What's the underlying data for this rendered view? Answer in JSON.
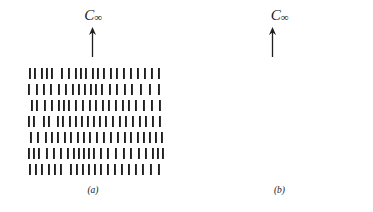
{
  "figure": {
    "background_color": "#ffffff",
    "ink_color": "#1f1f1f",
    "panels": [
      {
        "id": "a",
        "caption": "(a)",
        "axis_label_main": "C",
        "axis_label_subscript": "∞",
        "axis_arrow_direction": "up",
        "mesogen_style": "rod",
        "mesogen_polarity": "apolar",
        "row_count": 7,
        "description_rows": [
          {
            "direction": "none",
            "count": 21
          },
          {
            "direction": "none",
            "count": 19
          },
          {
            "direction": "none",
            "count": 20
          },
          {
            "direction": "none",
            "count": 21
          },
          {
            "direction": "none",
            "count": 21
          },
          {
            "direction": "none",
            "count": 22
          },
          {
            "direction": "none",
            "count": 20
          }
        ]
      },
      {
        "id": "b",
        "caption": "(b)",
        "axis_label_main": "C",
        "axis_label_subscript": "∞",
        "axis_arrow_direction": "up",
        "mesogen_style": "arrow",
        "mesogen_polarity": "polar",
        "row_count": 8,
        "description_rows": [
          {
            "direction": "down",
            "count": 21
          },
          {
            "direction": "up",
            "count": 20
          },
          {
            "direction": "down",
            "count": 21
          },
          {
            "direction": "up",
            "count": 20
          },
          {
            "direction": "down",
            "count": 21
          },
          {
            "direction": "up",
            "count": 21
          },
          {
            "direction": "down",
            "count": 22
          },
          {
            "direction": "up",
            "count": 22
          }
        ]
      }
    ]
  },
  "chart_data": {
    "type": "diagram",
    "title": "",
    "xlabel": "",
    "ylabel": "",
    "grid": false,
    "legend_position": "none",
    "panel_a": {
      "label": "(a)",
      "symmetry_axis": "C∞",
      "element_type": "rod",
      "rows": [
        {
          "y": 4,
          "x": [
            2,
            7,
            14,
            19,
            24,
            34,
            41,
            48,
            53,
            58,
            65,
            70,
            76,
            83,
            89,
            96,
            103,
            110,
            117,
            124,
            131
          ]
        },
        {
          "y": 20,
          "x": [
            1,
            9,
            16,
            23,
            31,
            38,
            45,
            51,
            57,
            63,
            68,
            74,
            82,
            89,
            97,
            104,
            113,
            122,
            131
          ]
        },
        {
          "y": 36,
          "x": [
            4,
            9,
            17,
            24,
            31,
            36,
            41,
            48,
            55,
            62,
            68,
            75,
            81,
            88,
            95,
            101,
            108,
            116,
            124,
            132
          ]
        },
        {
          "y": 52,
          "x": [
            1,
            6,
            16,
            21,
            30,
            35,
            42,
            48,
            54,
            60,
            66,
            72,
            78,
            85,
            92,
            98,
            105,
            112,
            118,
            125,
            132
          ]
        },
        {
          "y": 68,
          "x": [
            3,
            10,
            18,
            24,
            30,
            37,
            43,
            50,
            56,
            62,
            69,
            76,
            83,
            90,
            97,
            103,
            110,
            116,
            122,
            128,
            134
          ]
        },
        {
          "y": 84,
          "x": [
            1,
            6,
            11,
            19,
            26,
            33,
            40,
            46,
            51,
            56,
            61,
            66,
            73,
            80,
            88,
            96,
            103,
            111,
            118,
            125,
            130,
            135
          ]
        },
        {
          "y": 100,
          "x": [
            2,
            8,
            14,
            21,
            27,
            33,
            43,
            49,
            55,
            61,
            67,
            73,
            80,
            87,
            94,
            101,
            108,
            115,
            123,
            131
          ]
        }
      ]
    },
    "panel_b": {
      "label": "(b)",
      "symmetry_axis": "C∞",
      "element_type": "arrow",
      "rows": [
        {
          "y": 2,
          "dir": "down",
          "x": [
            4,
            12,
            17,
            24,
            31,
            38,
            44,
            51,
            58,
            64,
            70,
            77,
            83,
            90,
            96,
            103,
            110,
            117,
            124,
            131,
            138
          ]
        },
        {
          "y": 16,
          "dir": "up",
          "x": [
            3,
            10,
            16,
            23,
            30,
            36,
            43,
            50,
            56,
            63,
            70,
            77,
            84,
            91,
            98,
            105,
            112,
            119,
            127,
            137
          ]
        },
        {
          "y": 33,
          "dir": "down",
          "x": [
            2,
            9,
            14,
            20,
            27,
            34,
            40,
            47,
            53,
            59,
            65,
            72,
            79,
            86,
            93,
            100,
            107,
            114,
            122,
            130,
            138
          ]
        },
        {
          "y": 47,
          "dir": "up",
          "x": [
            4,
            11,
            18,
            25,
            32,
            39,
            45,
            52,
            58,
            65,
            71,
            78,
            85,
            92,
            99,
            106,
            113,
            120,
            128,
            136
          ]
        },
        {
          "y": 65,
          "dir": "down",
          "x": [
            2,
            8,
            14,
            22,
            29,
            36,
            43,
            49,
            55,
            61,
            67,
            73,
            80,
            87,
            94,
            101,
            108,
            115,
            122,
            129,
            136
          ]
        },
        {
          "y": 79,
          "dir": "up",
          "x": [
            3,
            9,
            15,
            21,
            28,
            35,
            42,
            48,
            54,
            60,
            67,
            74,
            81,
            88,
            95,
            101,
            107,
            113,
            120,
            127,
            134
          ]
        },
        {
          "y": 96,
          "dir": "down",
          "x": [
            2,
            8,
            14,
            20,
            26,
            33,
            40,
            47,
            53,
            59,
            65,
            71,
            78,
            85,
            92,
            98,
            104,
            111,
            118,
            124,
            130,
            137
          ]
        },
        {
          "y": 110,
          "dir": "up",
          "x": [
            3,
            9,
            15,
            21,
            27,
            34,
            41,
            47,
            53,
            59,
            65,
            72,
            79,
            86,
            92,
            98,
            105,
            112,
            118,
            125,
            131,
            138
          ]
        }
      ]
    }
  }
}
